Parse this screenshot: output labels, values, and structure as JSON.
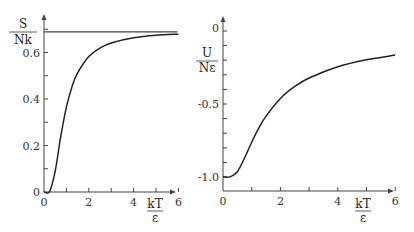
{
  "chart_data": [
    {
      "type": "line",
      "title": "",
      "xlabel": "kT/ε",
      "xlabel_num": "kT",
      "xlabel_den": "ε",
      "ylabel": "S/Nk",
      "ylabel_num": "S",
      "ylabel_den": "Nk",
      "xlim": [
        0,
        6
      ],
      "ylim": [
        0,
        0.72
      ],
      "x_ticks": [
        0,
        1,
        2,
        3,
        4,
        5,
        6
      ],
      "x_tick_labels": [
        "0",
        "2",
        "4",
        "6"
      ],
      "x_tick_label_values": [
        0,
        2,
        4,
        6
      ],
      "y_ticks": [
        0,
        0.1,
        0.2,
        0.3,
        0.4,
        0.5,
        0.6,
        0.7
      ],
      "y_tick_labels": [
        "0",
        "0.2",
        "0.4",
        "0.6"
      ],
      "y_tick_label_values": [
        0,
        0.2,
        0.4,
        0.6
      ],
      "grid": false,
      "legend": null,
      "asymptote": {
        "value": 0.693,
        "label": "ln 2"
      },
      "x": [
        0,
        0.25,
        0.5,
        0.75,
        1,
        1.25,
        1.5,
        2,
        2.5,
        3,
        4,
        5,
        6
      ],
      "series": [
        {
          "name": "S/Nk",
          "values": [
            0,
            0.003,
            0.09,
            0.24,
            0.365,
            0.453,
            0.512,
            0.583,
            0.619,
            0.641,
            0.663,
            0.674,
            0.679
          ]
        }
      ]
    },
    {
      "type": "line",
      "title": "",
      "xlabel": "kT/ε",
      "xlabel_num": "kT",
      "xlabel_den": "ε",
      "ylabel": "U/Nε",
      "ylabel_num": "U",
      "ylabel_den": "Nε",
      "xlim": [
        0,
        6
      ],
      "ylim": [
        -1.1,
        0.1
      ],
      "x_ticks": [
        0,
        1,
        2,
        3,
        4,
        5,
        6
      ],
      "x_tick_labels": [
        "0",
        "2",
        "4",
        "6"
      ],
      "x_tick_label_values": [
        0,
        2,
        4,
        6
      ],
      "y_ticks": [
        0,
        -0.1,
        -0.2,
        -0.3,
        -0.4,
        -0.5,
        -0.6,
        -0.7,
        -0.8,
        -0.9,
        -1.0
      ],
      "y_tick_labels": [
        "0",
        "-0.5",
        "-1.0"
      ],
      "y_tick_label_values": [
        0,
        -0.5,
        -1.0
      ],
      "grid": false,
      "legend": null,
      "x": [
        0,
        0.25,
        0.5,
        0.75,
        1,
        1.25,
        1.5,
        2,
        2.5,
        3,
        4,
        5,
        6
      ],
      "series": [
        {
          "name": "U/Nε",
          "values": [
            -1.0,
            -0.999,
            -0.964,
            -0.87,
            -0.762,
            -0.664,
            -0.583,
            -0.462,
            -0.38,
            -0.322,
            -0.245,
            -0.197,
            -0.165
          ]
        }
      ]
    }
  ],
  "style": {
    "line_color": "#222222",
    "axis_color": "#444444",
    "asymptote_color": "#444444"
  }
}
